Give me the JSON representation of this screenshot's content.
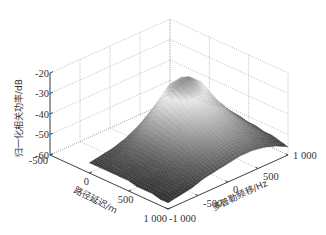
{
  "chart_data": {
    "type": "surface3d",
    "title": "",
    "x_axis": {
      "label": "路径延迟/m",
      "range": [
        -500,
        1000
      ],
      "ticks": [
        -500,
        0,
        500,
        1000
      ],
      "tick_labels": [
        "-500",
        "0",
        "500",
        "1 000"
      ]
    },
    "y_axis": {
      "label": "多普勒频移/Hz",
      "range": [
        -1000,
        1000
      ],
      "ticks": [
        -1000,
        -500,
        0,
        500,
        1000
      ],
      "tick_labels": [
        "-1 000",
        "-500",
        "0",
        "500",
        "1 000"
      ]
    },
    "z_axis": {
      "label": "归一化相关功率/dB",
      "range": [
        -60,
        -20
      ],
      "ticks": [
        -60,
        -50,
        -40,
        -30,
        -20
      ],
      "tick_labels": [
        "-60",
        "-50",
        "-40",
        "-30",
        "-20"
      ]
    },
    "grid": true,
    "colormap": "gray",
    "surface": {
      "delay_m": [
        0,
        100,
        200,
        300,
        400,
        500,
        600,
        700,
        800,
        900,
        1000
      ],
      "doppler_hz": [
        -1000,
        -800,
        -600,
        -400,
        -200,
        0,
        200,
        400,
        600,
        800,
        1000
      ],
      "power_db": [
        [
          -55,
          -54,
          -53,
          -51,
          -48,
          -44,
          -40,
          -38,
          -42,
          -48,
          -53
        ],
        [
          -55,
          -54,
          -52,
          -49,
          -44,
          -37,
          -31,
          -30,
          -35,
          -45,
          -52
        ],
        [
          -55,
          -53,
          -51,
          -47,
          -41,
          -34,
          -29,
          -28,
          -33,
          -43,
          -51
        ],
        [
          -55,
          -53,
          -51,
          -47,
          -42,
          -36,
          -31,
          -31,
          -36,
          -45,
          -52
        ],
        [
          -55,
          -54,
          -51,
          -48,
          -43,
          -38,
          -34,
          -34,
          -39,
          -46,
          -52
        ],
        [
          -55,
          -54,
          -52,
          -48,
          -44,
          -40,
          -37,
          -37,
          -41,
          -47,
          -53
        ],
        [
          -56,
          -54,
          -52,
          -49,
          -45,
          -42,
          -39,
          -40,
          -43,
          -48,
          -53
        ],
        [
          -56,
          -55,
          -53,
          -50,
          -47,
          -44,
          -42,
          -42,
          -45,
          -49,
          -54
        ],
        [
          -56,
          -55,
          -53,
          -51,
          -48,
          -46,
          -44,
          -45,
          -47,
          -50,
          -54
        ],
        [
          -57,
          -55,
          -54,
          -52,
          -50,
          -48,
          -47,
          -47,
          -49,
          -52,
          -55
        ],
        [
          -57,
          -56,
          -55,
          -53,
          -52,
          -51,
          -50,
          -50,
          -51,
          -53,
          -56
        ]
      ]
    }
  }
}
